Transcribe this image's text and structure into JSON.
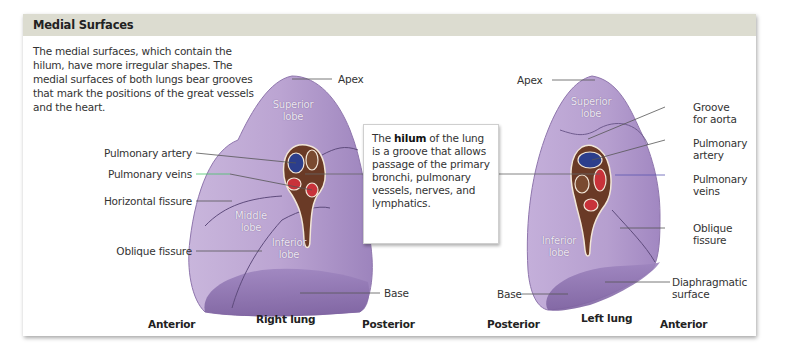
{
  "panel": {
    "title": "Medial Surfaces",
    "intro": "The medial surfaces, which contain the hilum, have more irregular shapes. The medial surfaces of both lungs bear grooves that mark the positions of the great vessels and the heart."
  },
  "callout": {
    "pre": "The ",
    "term": "hilum",
    "post": " of the lung is a groove that allows passage of the primary bronchi, pulmonary vessels, nerves, and lymphatics."
  },
  "right_lung": {
    "name": "Right lung",
    "orientation_left": "Anterior",
    "orientation_right": "Posterior",
    "labels": {
      "apex": "Apex",
      "pulmonary_artery": "Pulmonary artery",
      "pulmonary_veins": "Pulmonary veins",
      "horizontal_fissure": "Horizontal fissure",
      "oblique_fissure": "Oblique fissure",
      "base": "Base"
    },
    "lobes": {
      "superior": [
        "Superior",
        "lobe"
      ],
      "middle": [
        "Middle",
        "lobe"
      ],
      "inferior": [
        "Inferior",
        "lobe"
      ]
    }
  },
  "left_lung": {
    "name": "Left lung",
    "orientation_left": "Posterior",
    "orientation_right": "Anterior",
    "labels": {
      "apex": "Apex",
      "groove_for_aorta": [
        "Groove",
        "for aorta"
      ],
      "pulmonary_artery": [
        "Pulmonary",
        "artery"
      ],
      "pulmonary_veins": [
        "Pulmonary",
        "veins"
      ],
      "oblique_fissure": [
        "Oblique",
        "fissure"
      ],
      "diaphragmatic_surface": [
        "Diaphragmatic",
        "surface"
      ],
      "base": "Base"
    },
    "lobes": {
      "superior": [
        "Superior",
        "lobe"
      ],
      "inferior": [
        "Inferior",
        "lobe"
      ]
    }
  },
  "colors": {
    "header_bg": "#dcdcd0",
    "lung_fill": "#b9a2cf",
    "lung_dark": "#8d72ae",
    "hilum_brown": "#6a3a26",
    "artery_blue": "#2c3e8c",
    "vein_red": "#c8323a",
    "leader_line": "#555555",
    "vein_leader": "#46c46a"
  }
}
